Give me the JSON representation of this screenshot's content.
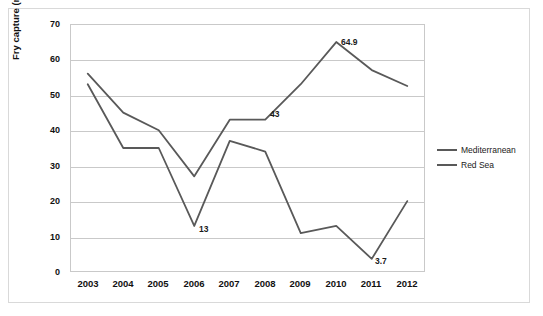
{
  "chart_data": {
    "type": "line",
    "title": "",
    "xlabel": "",
    "ylabel": "Fry capture (million)",
    "categories": [
      "2003",
      "2004",
      "2005",
      "2006",
      "2007",
      "2008",
      "2009",
      "2010",
      "2011",
      "2012"
    ],
    "ylim": [
      0,
      70
    ],
    "ytick_values": [
      "0",
      "10",
      "20",
      "30",
      "40",
      "50",
      "60",
      "70"
    ],
    "grid": true,
    "legend_position": "right",
    "series": [
      {
        "name": "Mediterranean",
        "color": "#595959",
        "values": [
          56,
          45,
          40,
          27,
          43,
          43,
          53,
          64.9,
          57,
          52.5
        ]
      },
      {
        "name": "Red Sea",
        "color": "#595959",
        "values": [
          53,
          35,
          35,
          13,
          37,
          34,
          11,
          13,
          3.7,
          20
        ]
      }
    ],
    "annotations": [
      {
        "text": "13",
        "series": "Red Sea",
        "category": "2006",
        "value": 13
      },
      {
        "text": "43",
        "series": "Mediterranean",
        "category": "2008",
        "value": 43
      },
      {
        "text": "64.9",
        "series": "Mediterranean",
        "category": "2010",
        "value": 64.9
      },
      {
        "text": "3.7",
        "series": "Red Sea",
        "category": "2011",
        "value": 3.7
      }
    ]
  },
  "legend": {
    "items": [
      {
        "label": "Mediterranean"
      },
      {
        "label": "Red Sea"
      }
    ]
  }
}
